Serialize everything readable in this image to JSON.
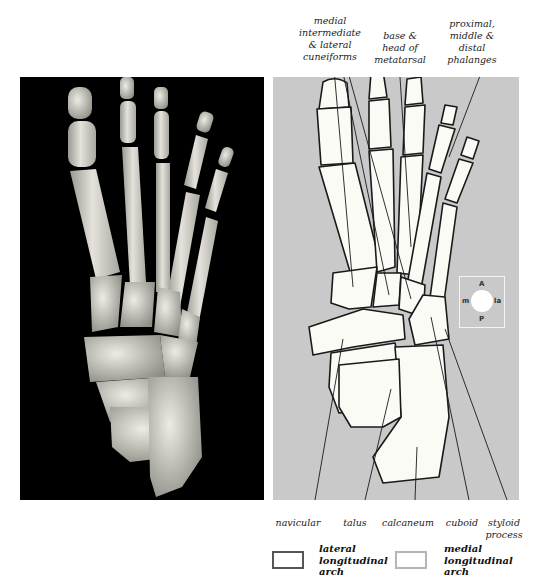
{
  "figure": {
    "left_panel": {
      "type": "photograph",
      "subject": "foot-skeleton-dorsal-view",
      "background": "#000000"
    },
    "right_panel": {
      "type": "line-drawing",
      "subject": "foot-skeleton-dorsal-view",
      "background": "#c9c9c9"
    }
  },
  "labels": {
    "top": [
      {
        "id": "cuneiforms",
        "lines": [
          "medial",
          "intermediate",
          "& lateral",
          "cuneiforms"
        ]
      },
      {
        "id": "metatarsal",
        "lines": [
          "base &",
          "head of",
          "metatarsal"
        ]
      },
      {
        "id": "phalanges",
        "lines": [
          "proximal,",
          "middle &",
          "distal",
          "phalanges"
        ]
      }
    ],
    "bottom": [
      {
        "id": "navicular",
        "lines": [
          "navicular"
        ]
      },
      {
        "id": "talus",
        "lines": [
          "talus"
        ]
      },
      {
        "id": "calcaneum",
        "lines": [
          "calcaneum"
        ]
      },
      {
        "id": "cuboid",
        "lines": [
          "cuboid"
        ]
      },
      {
        "id": "styloid",
        "lines": [
          "styloid",
          "process"
        ]
      }
    ]
  },
  "compass": {
    "anterior": "A",
    "posterior": "P",
    "medial": "m",
    "lateral": "la"
  },
  "legend": [
    {
      "label_lines": [
        "lateral",
        "longitudinal",
        "arch"
      ],
      "border_color": "#555555"
    },
    {
      "label_lines": [
        "medial",
        "longitudinal",
        "arch"
      ],
      "border_color": "#b5b5b5"
    }
  ],
  "colors": {
    "bone_fill": "#fbfbf6",
    "outline": "#1a1a1a",
    "panel_gray": "#c9c9c9"
  }
}
